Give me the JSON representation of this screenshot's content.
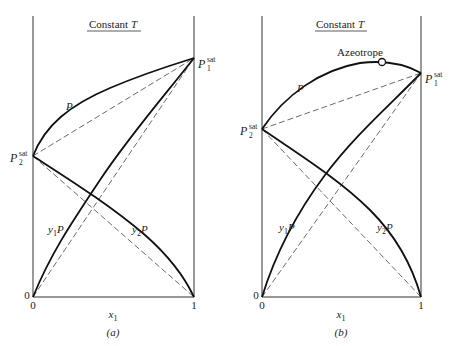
{
  "figure": {
    "panels": [
      {
        "id": "a",
        "caption": "(a)",
        "title": "Constant T",
        "title_prefix": "Constant ",
        "title_var": "T",
        "x_axis_label": "x",
        "x_axis_sub": "1",
        "x_ticks": [
          "0",
          "1"
        ],
        "y_origin_label": "0",
        "curve_labels": {
          "total": "P",
          "partial1": "y",
          "partial1_sub": "1",
          "partial1_var": "P",
          "partial2": "y",
          "partial2_sub": "2",
          "partial2_var": "P"
        },
        "endpoint_labels": {
          "p1": "P",
          "p1_sub": "1",
          "p1_sup": "sat",
          "p2": "P",
          "p2_sub": "2",
          "p2_sup": "sat"
        }
      },
      {
        "id": "b",
        "caption": "(b)",
        "title": "Constant T",
        "title_prefix": "Constant ",
        "title_var": "T",
        "x_axis_label": "x",
        "x_axis_sub": "1",
        "x_ticks": [
          "0",
          "1"
        ],
        "y_origin_label": "0",
        "annotation": "Azeotrope",
        "curve_labels": {
          "total": "P",
          "partial1": "y",
          "partial1_sub": "1",
          "partial1_var": "P",
          "partial2": "y",
          "partial2_sub": "2",
          "partial2_var": "P"
        },
        "endpoint_labels": {
          "p1": "P",
          "p1_sub": "1",
          "p1_sup": "sat",
          "p2": "P",
          "p2_sub": "2",
          "p2_sup": "sat"
        }
      }
    ]
  }
}
